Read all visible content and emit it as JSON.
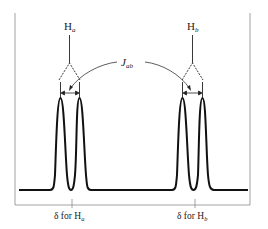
{
  "diagram": {
    "type": "NMR doublet splitting diagram",
    "labels": {
      "proton_a": "H",
      "proton_a_sub": "a",
      "proton_b": "H",
      "proton_b_sub": "b",
      "coupling": "J",
      "coupling_sub": "ab",
      "delta_a": "δ for H",
      "delta_a_sub": "a",
      "delta_b": "δ for H",
      "delta_b_sub": "b"
    },
    "colors": {
      "line": "#111111",
      "frame": "#888888",
      "text": "#222222"
    }
  }
}
